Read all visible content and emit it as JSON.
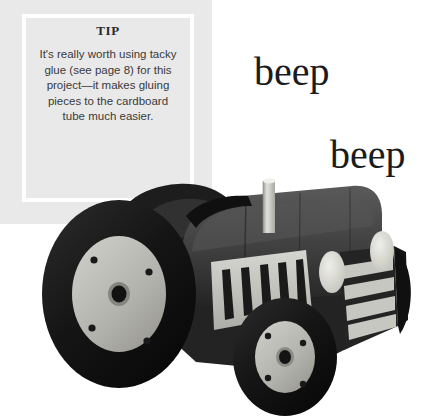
{
  "page": {
    "background_color": "#ffffff",
    "width": 422,
    "height": 417
  },
  "tip_box": {
    "heading": "TIP",
    "body": "It's really worth using tacky glue (see page 8) for this project—it makes gluing pieces to the cardboard tube much easier.",
    "panel_color": "#e9e9e9",
    "border_color": "#ffffff",
    "text_color": "#3a3a3a"
  },
  "sound_effects": [
    {
      "text": "beep"
    },
    {
      "text": "beep"
    }
  ],
  "photo": {
    "subject": "cardboard-tube-tractor",
    "colors": {
      "tire": "#1c1c1c",
      "body_dark": "#2e2e2e",
      "body_mid": "#4a4a4a",
      "hub": "#b9b9b4",
      "panel_light": "#c9c9c4",
      "exhaust": "#d2d2cd",
      "headlight": "#dcdcd7"
    },
    "parts": [
      "rear-wheel",
      "front-wheel",
      "engine-hood",
      "side-grille-panel",
      "front-grille-stripes",
      "headlights",
      "exhaust-pipe",
      "seat",
      "rear-fender"
    ]
  }
}
